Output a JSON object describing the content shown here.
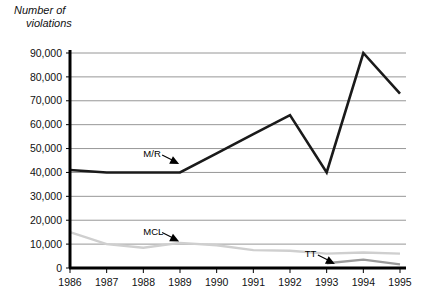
{
  "chart_data": {
    "type": "line",
    "title": "Number of violations",
    "title_line1": "Number of",
    "title_line2": "violations",
    "xlabel": "",
    "ylabel": "Number of violations",
    "x": [
      1986,
      1987,
      1988,
      1989,
      1990,
      1991,
      1992,
      1993,
      1994,
      1995
    ],
    "categories": [
      "1986",
      "1987",
      "1988",
      "1989",
      "1990",
      "1991",
      "1992",
      "1993",
      "1994",
      "1995"
    ],
    "ylim": [
      0,
      90000
    ],
    "xlim": [
      1986,
      1995
    ],
    "ytick_labels": [
      "0",
      "10,000",
      "20,000",
      "30,000",
      "40,000",
      "50,000",
      "60,000",
      "70,000",
      "80,000",
      "90,000"
    ],
    "ytick_values": [
      0,
      10000,
      20000,
      30000,
      40000,
      50000,
      60000,
      70000,
      80000,
      90000
    ],
    "grid": true,
    "grid_axis": "y",
    "legend": "inline-annotations",
    "series": [
      {
        "name": "M/R",
        "color": "#1a1a1a",
        "width": 2.6,
        "values": [
          41000,
          40000,
          40000,
          40000,
          48000,
          56000,
          64000,
          40000,
          90000,
          73000
        ]
      },
      {
        "name": "MCL",
        "color": "#cfcfcf",
        "width": 2.4,
        "values": [
          15000,
          10000,
          8500,
          10500,
          9500,
          7500,
          7200,
          6000,
          6500,
          6000
        ]
      },
      {
        "name": "TT",
        "color": "#9a9a9a",
        "width": 2.4,
        "values": [
          null,
          null,
          null,
          null,
          null,
          null,
          null,
          2000,
          3500,
          1500
        ]
      }
    ],
    "annotations": [
      {
        "text": "M/R",
        "points_to": "M/R series",
        "label_x": 1988.0,
        "label_y": 46500
      },
      {
        "text": "MCL",
        "points_to": "MCL series",
        "label_x": 1988.0,
        "label_y": 14000
      },
      {
        "text": "TT",
        "points_to": "TT series",
        "label_x": 1992.4,
        "label_y": 4600
      }
    ]
  }
}
